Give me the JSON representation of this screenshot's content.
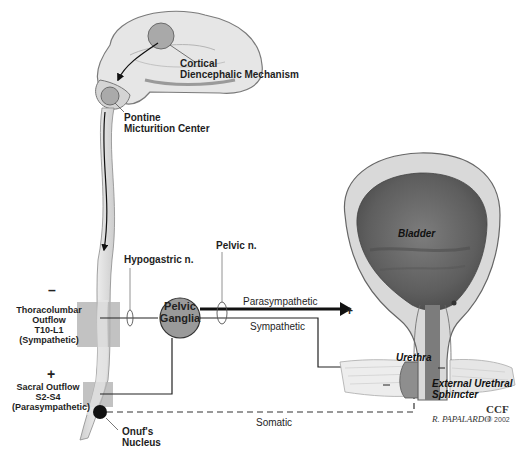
{
  "diagram": {
    "labels": {
      "cortical": [
        "Cortical",
        "Diencephalic Mechanism"
      ],
      "pontine": [
        "Pontine",
        "Micturition Center"
      ],
      "hypogastric": "Hypogastric n.",
      "pelvic_nerve": "Pelvic n.",
      "thoracolumbar": [
        "Thoracolumbar",
        "Outflow",
        "T10-L1",
        "(Sympathetic)"
      ],
      "thoracolumbar_sign": "–",
      "sacral": [
        "Sacral Outflow",
        "S2-S4",
        "(Parasympathetic)"
      ],
      "sacral_sign": "+",
      "onufs": [
        "Onuf's",
        "Nucleus"
      ],
      "pelvic_ganglia": [
        "Pelvic",
        "Ganglia"
      ],
      "parasympathetic": "Parasympathetic",
      "sympathetic": "Sympathetic",
      "somatic": "Somatic",
      "bladder": "Bladder",
      "bladder_sign": "+",
      "urethra": "Urethra",
      "urethra_sign": "–",
      "sphincter": [
        "External Urethral",
        "Sphincter"
      ],
      "sphincter_sign": "–"
    },
    "credits": {
      "ccf": "CCF",
      "signature": "R. PAPALARDO",
      "copyright": "© 2002"
    },
    "colors": {
      "brain": "#e4e4e4",
      "brain_outline": "#7a7a7a",
      "nucleus": "#a8a8a8",
      "spinal_cord": "#e2e2e2",
      "outflow_box": "#b3b3b3",
      "ganglia": "#9a9a9a",
      "bladder_wall": "#d9d9d9",
      "bladder_lumen": "#6e6e6e",
      "onuf": "#111111",
      "line": "#222222"
    }
  }
}
